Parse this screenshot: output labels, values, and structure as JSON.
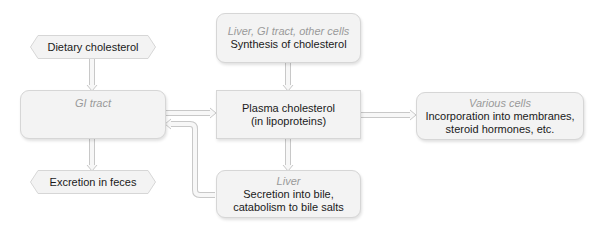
{
  "diagram": {
    "type": "flowchart",
    "colors": {
      "box_fill": "#f3f3f3",
      "box_border": "#d6d6d6",
      "arrow": "#c8c8c8",
      "arrow_fill": "#f7f7f7",
      "location_label": "#9a9a9a",
      "text": "#1a1a1a"
    },
    "nodes": {
      "dietary": {
        "label": "Dietary cholesterol",
        "shape": "hexagon"
      },
      "gi_tract": {
        "location": "GI tract",
        "label": "",
        "shape": "rounded"
      },
      "excretion": {
        "label": "Excretion in feces",
        "shape": "hexagon"
      },
      "synthesis": {
        "location": "Liver, GI tract, other cells",
        "label": "Synthesis of cholesterol",
        "shape": "rounded"
      },
      "plasma": {
        "line1": "Plasma cholesterol",
        "line2": "(in lipoproteins)",
        "shape": "rectangle"
      },
      "liver": {
        "location": "Liver",
        "line1": "Secretion into bile,",
        "line2": "catabolism to bile salts",
        "shape": "rounded"
      },
      "cells": {
        "location": "Various cells",
        "line1": "Incorporation into membranes,",
        "line2": "steroid hormones, etc.",
        "shape": "rounded"
      }
    },
    "edges": [
      {
        "from": "dietary",
        "to": "gi_tract"
      },
      {
        "from": "gi_tract",
        "to": "excretion"
      },
      {
        "from": "gi_tract",
        "to": "plasma"
      },
      {
        "from": "synthesis",
        "to": "plasma"
      },
      {
        "from": "plasma",
        "to": "cells"
      },
      {
        "from": "plasma",
        "to": "liver"
      },
      {
        "from": "liver",
        "to": "gi_tract"
      }
    ]
  }
}
